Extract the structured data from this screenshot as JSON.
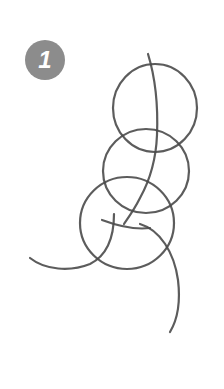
{
  "step": {
    "number": "1",
    "badge_color": "#8c8c8c",
    "text_color": "#ffffff"
  },
  "sketch": {
    "stroke_color": "#4a4a4a",
    "circles": [
      {
        "name": "top-circle",
        "cx": 155,
        "cy": 108,
        "rx": 42,
        "ry": 44
      },
      {
        "name": "middle-circle",
        "cx": 146,
        "cy": 171,
        "rx": 43,
        "ry": 42
      },
      {
        "name": "bottom-circle",
        "cx": 127,
        "cy": 223,
        "rx": 47,
        "ry": 46
      }
    ]
  }
}
